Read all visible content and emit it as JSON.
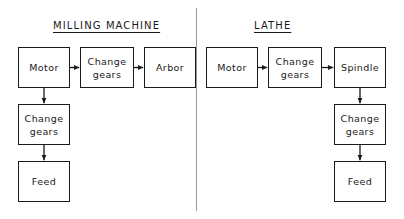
{
  "diagram": {
    "title_milling": "MILLING MACHINE",
    "title_lathe": "LATHE",
    "sections": [
      {
        "id": "milling",
        "heading": "MILLING MACHINE",
        "nodes": [
          {
            "id": "milling-motor",
            "label": "Motor"
          },
          {
            "id": "milling-change-gears-top",
            "label": "Change\ngears"
          },
          {
            "id": "milling-arbor",
            "label": "Arbor"
          },
          {
            "id": "milling-change-gears-bottom",
            "label": "Change\ngears"
          },
          {
            "id": "milling-feed",
            "label": "Feed"
          }
        ]
      },
      {
        "id": "lathe",
        "heading": "LATHE",
        "nodes": [
          {
            "id": "lathe-motor",
            "label": "Motor"
          },
          {
            "id": "lathe-change-gears-top",
            "label": "Change\ngears"
          },
          {
            "id": "lathe-spindle",
            "label": "Spindle"
          },
          {
            "id": "lathe-change-gears-bottom",
            "label": "Change\ngears"
          },
          {
            "id": "lathe-feed",
            "label": "Feed"
          }
        ]
      }
    ],
    "colors": {
      "stroke": "#1a1a1a",
      "background": "#ffffff",
      "divider": "#9a9a9a"
    }
  }
}
